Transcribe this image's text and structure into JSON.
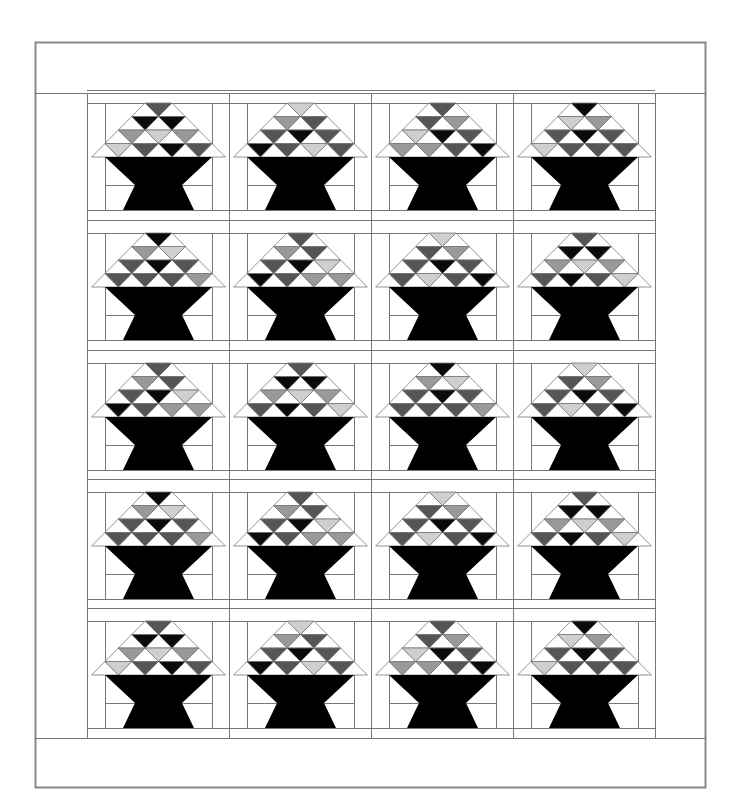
{
  "diagram": {
    "type": "quilt-layout",
    "block_name": "basket",
    "grid": {
      "rows": 5,
      "cols": 4
    },
    "colors": {
      "B": "#0a0a0a",
      "D": "#555555",
      "M": "#999999",
      "L": "#cfcfcf",
      "W": "#ffffff",
      "line": "#777777",
      "border": "#888888",
      "basket": "#000000"
    },
    "legend_codes": {
      "B": "black",
      "D": "dark gray",
      "M": "medium gray",
      "L": "light gray"
    },
    "blocks": [
      [
        {
          "rows": [
            [
              "D"
            ],
            [
              "B",
              "B"
            ],
            [
              "M",
              "L",
              "M"
            ],
            [
              "L",
              "D",
              "B",
              "D"
            ]
          ]
        },
        {
          "rows": [
            [
              "L"
            ],
            [
              "M",
              "D"
            ],
            [
              "D",
              "B",
              "D"
            ],
            [
              "B",
              "D",
              "L",
              "D"
            ]
          ]
        },
        {
          "rows": [
            [
              "D"
            ],
            [
              "D",
              "M"
            ],
            [
              "L",
              "B",
              "D"
            ],
            [
              "M",
              "M",
              "D",
              "B"
            ]
          ]
        },
        {
          "rows": [
            [
              "B"
            ],
            [
              "L",
              "M"
            ],
            [
              "D",
              "B",
              "D"
            ],
            [
              "L",
              "D",
              "D",
              "D"
            ]
          ]
        }
      ],
      [
        {
          "rows": [
            [
              "B"
            ],
            [
              "M",
              "L"
            ],
            [
              "D",
              "B",
              "D"
            ],
            [
              "D",
              "D",
              "D",
              "M"
            ]
          ]
        },
        {
          "rows": [
            [
              "D"
            ],
            [
              "M",
              "D"
            ],
            [
              "D",
              "B",
              "L"
            ],
            [
              "B",
              "D",
              "M",
              "M"
            ]
          ]
        },
        {
          "rows": [
            [
              "L"
            ],
            [
              "D",
              "M"
            ],
            [
              "D",
              "B",
              "D"
            ],
            [
              "D",
              "L",
              "D",
              "B"
            ]
          ]
        },
        {
          "rows": [
            [
              "D"
            ],
            [
              "B",
              "B"
            ],
            [
              "M",
              "L",
              "M"
            ],
            [
              "D",
              "B",
              "D",
              "L"
            ]
          ]
        }
      ],
      [
        {
          "rows": [
            [
              "D"
            ],
            [
              "M",
              "D"
            ],
            [
              "D",
              "B",
              "L"
            ],
            [
              "B",
              "D",
              "M",
              "M"
            ]
          ]
        },
        {
          "rows": [
            [
              "D"
            ],
            [
              "B",
              "B"
            ],
            [
              "M",
              "L",
              "M"
            ],
            [
              "D",
              "B",
              "D",
              "L"
            ]
          ]
        },
        {
          "rows": [
            [
              "B"
            ],
            [
              "M",
              "L"
            ],
            [
              "D",
              "B",
              "D"
            ],
            [
              "D",
              "D",
              "D",
              "M"
            ]
          ]
        },
        {
          "rows": [
            [
              "L"
            ],
            [
              "D",
              "M"
            ],
            [
              "D",
              "B",
              "D"
            ],
            [
              "D",
              "L",
              "D",
              "B"
            ]
          ]
        }
      ],
      [
        {
          "rows": [
            [
              "B"
            ],
            [
              "M",
              "L"
            ],
            [
              "D",
              "B",
              "D"
            ],
            [
              "D",
              "D",
              "D",
              "M"
            ]
          ]
        },
        {
          "rows": [
            [
              "D"
            ],
            [
              "M",
              "D"
            ],
            [
              "D",
              "B",
              "L"
            ],
            [
              "B",
              "D",
              "M",
              "M"
            ]
          ]
        },
        {
          "rows": [
            [
              "L"
            ],
            [
              "D",
              "M"
            ],
            [
              "D",
              "B",
              "D"
            ],
            [
              "D",
              "L",
              "D",
              "B"
            ]
          ]
        },
        {
          "rows": [
            [
              "D"
            ],
            [
              "B",
              "B"
            ],
            [
              "M",
              "L",
              "M"
            ],
            [
              "D",
              "B",
              "D",
              "L"
            ]
          ]
        }
      ],
      [
        {
          "rows": [
            [
              "D"
            ],
            [
              "B",
              "B"
            ],
            [
              "M",
              "L",
              "M"
            ],
            [
              "L",
              "D",
              "B",
              "D"
            ]
          ]
        },
        {
          "rows": [
            [
              "L"
            ],
            [
              "M",
              "D"
            ],
            [
              "D",
              "B",
              "D"
            ],
            [
              "B",
              "D",
              "L",
              "D"
            ]
          ]
        },
        {
          "rows": [
            [
              "D"
            ],
            [
              "D",
              "M"
            ],
            [
              "L",
              "B",
              "D"
            ],
            [
              "M",
              "M",
              "D",
              "B"
            ]
          ]
        },
        {
          "rows": [
            [
              "B"
            ],
            [
              "L",
              "M"
            ],
            [
              "D",
              "B",
              "D"
            ],
            [
              "L",
              "D",
              "D",
              "D"
            ]
          ]
        }
      ]
    ]
  }
}
